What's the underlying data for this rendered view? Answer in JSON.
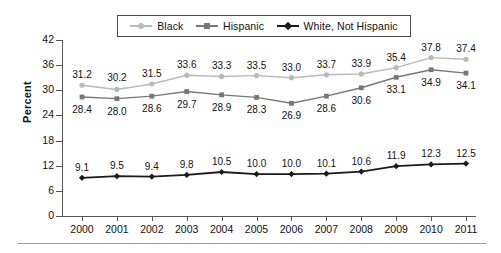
{
  "chart_data": {
    "type": "line",
    "title": "",
    "xlabel": "",
    "ylabel": "Percent",
    "ylim": [
      0,
      42
    ],
    "yticks": [
      0,
      6,
      12,
      18,
      24,
      30,
      36,
      42
    ],
    "grid": false,
    "legend_position": "top-center",
    "categories": [
      "2000",
      "2001",
      "2002",
      "2003",
      "2004",
      "2005",
      "2006",
      "2007",
      "2008",
      "2009",
      "2010",
      "2011"
    ],
    "series": [
      {
        "name": "Black",
        "color": "#b9b9b9",
        "marker": "circle",
        "values": [
          31.2,
          30.2,
          31.5,
          33.6,
          33.3,
          33.5,
          33.0,
          33.7,
          33.9,
          35.4,
          37.8,
          37.4
        ],
        "labels": [
          "31.2",
          "30.2",
          "31.5",
          "33.6",
          "33.3",
          "33.5",
          "33.0",
          "33.7",
          "33.9",
          "35.4",
          "37.8",
          "37.4"
        ]
      },
      {
        "name": "Hispanic",
        "color": "#777777",
        "marker": "square",
        "values": [
          28.4,
          28.0,
          28.6,
          29.7,
          28.9,
          28.3,
          26.9,
          28.6,
          30.6,
          33.1,
          34.9,
          34.1
        ],
        "labels": [
          "28.4",
          "28.0",
          "28.6",
          "29.7",
          "28.9",
          "28.3",
          "26.9",
          "28.6",
          "30.6",
          "33.1",
          "34.9",
          "34.1"
        ]
      },
      {
        "name": "White, Not Hispanic",
        "color": "#1a1a1a",
        "marker": "diamond",
        "values": [
          9.1,
          9.5,
          9.4,
          9.8,
          10.5,
          10.0,
          10.0,
          10.1,
          10.6,
          11.9,
          12.3,
          12.5
        ],
        "labels": [
          "9.1",
          "9.5",
          "9.4",
          "9.8",
          "10.5",
          "10.0",
          "10.0",
          "10.1",
          "10.6",
          "11.9",
          "12.3",
          "12.5"
        ]
      }
    ]
  },
  "legend": {
    "entries": [
      {
        "label": "Black"
      },
      {
        "label": "Hispanic"
      },
      {
        "label": "White, Not Hispanic"
      }
    ]
  },
  "axis": {
    "y_title": "Percent"
  }
}
